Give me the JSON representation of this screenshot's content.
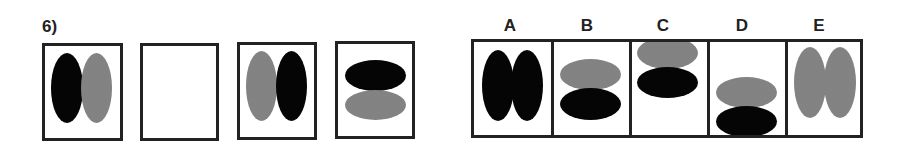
{
  "question": {
    "number_label": "6)",
    "sequence": [
      {
        "id": "seq-1",
        "shapes": [
          {
            "orientation": "vertical",
            "color": "black",
            "position": "left"
          },
          {
            "orientation": "vertical",
            "color": "gray",
            "position": "right"
          }
        ]
      },
      {
        "id": "seq-2",
        "shapes": [],
        "blank": true
      },
      {
        "id": "seq-3",
        "shapes": [
          {
            "orientation": "vertical",
            "color": "gray",
            "position": "left"
          },
          {
            "orientation": "vertical",
            "color": "black",
            "position": "right"
          }
        ]
      },
      {
        "id": "seq-4",
        "shapes": [
          {
            "orientation": "horizontal",
            "color": "black",
            "position": "top"
          },
          {
            "orientation": "horizontal",
            "color": "gray",
            "position": "bottom"
          }
        ]
      }
    ]
  },
  "options": [
    {
      "label": "A",
      "shapes": [
        {
          "orientation": "vertical",
          "color": "black",
          "position": "left"
        },
        {
          "orientation": "vertical",
          "color": "black",
          "position": "right"
        }
      ]
    },
    {
      "label": "B",
      "shapes": [
        {
          "orientation": "horizontal",
          "color": "gray",
          "position": "top"
        },
        {
          "orientation": "horizontal",
          "color": "black",
          "position": "bottom"
        }
      ]
    },
    {
      "label": "C",
      "shapes": [
        {
          "orientation": "horizontal",
          "color": "gray",
          "position": "top-high"
        },
        {
          "orientation": "horizontal",
          "color": "black",
          "position": "bottom-high"
        }
      ]
    },
    {
      "label": "D",
      "shapes": [
        {
          "orientation": "horizontal",
          "color": "gray",
          "position": "top-low"
        },
        {
          "orientation": "horizontal",
          "color": "black",
          "position": "bottom-low"
        }
      ]
    },
    {
      "label": "E",
      "shapes": [
        {
          "orientation": "vertical",
          "color": "gray",
          "position": "left"
        },
        {
          "orientation": "vertical",
          "color": "gray",
          "position": "right"
        }
      ]
    }
  ],
  "colors": {
    "black": "#050505",
    "gray": "#8a8a8a",
    "border": "#222222"
  }
}
